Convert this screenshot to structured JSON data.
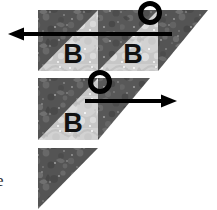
{
  "figure": {
    "background_color": "#ffffff"
  },
  "palette": {
    "dark_fabric": "#5d5d5d",
    "dark_fabric_shadow": "#474747",
    "dark_fabric_speck": "#8f8f8f",
    "light_fabric": "#d3d3d3",
    "light_fabric_speck": "#ffffff",
    "light_fabric_shadow": "#a8a8a8",
    "ink": "#000000",
    "caption_ink": "#2a2a2a"
  },
  "labels": {
    "block_letter": "B",
    "corner_caption": "e"
  },
  "rows": [
    {
      "name": "row-1",
      "blocks": [
        {
          "label": "B",
          "kind": "half-square-triangle"
        },
        {
          "label": "B",
          "kind": "half-square-triangle"
        },
        {
          "label": "",
          "kind": "setting-triangle"
        }
      ]
    },
    {
      "name": "row-2",
      "blocks": [
        {
          "label": "B",
          "kind": "half-square-triangle"
        },
        {
          "label": "",
          "kind": "setting-triangle"
        }
      ]
    },
    {
      "name": "row-3",
      "blocks": [
        {
          "label": "",
          "kind": "setting-triangle"
        }
      ]
    }
  ],
  "arrows": [
    {
      "name": "arrow-left",
      "direction": "left",
      "row": "row-1"
    },
    {
      "name": "arrow-right",
      "direction": "right",
      "row": "row-2"
    }
  ],
  "markers": [
    {
      "name": "circle-marker-top",
      "shape": "circle-outline"
    },
    {
      "name": "circle-marker-middle",
      "shape": "circle-outline"
    }
  ]
}
